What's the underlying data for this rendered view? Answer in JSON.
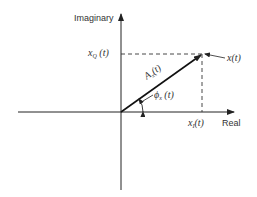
{
  "diagram": {
    "type": "phasor-diagram",
    "axes": {
      "vertical_label": "Imaginary",
      "horizontal_label": "Real"
    },
    "labels": {
      "quadrature_component": {
        "symbol": "x",
        "subscript": "Q",
        "arg": "(t)"
      },
      "inphase_component": {
        "symbol": "x",
        "subscript": "I",
        "arg": "(t)"
      },
      "signal": {
        "symbol": "x",
        "arg": "(t)"
      },
      "amplitude": {
        "symbol": "A",
        "subscript": "x",
        "arg": "(t)"
      },
      "phase": {
        "symbol": "ϕ",
        "subscript": "x",
        "arg": "(t)"
      }
    },
    "colors": {
      "line": "#222222",
      "background": "#ffffff"
    }
  }
}
